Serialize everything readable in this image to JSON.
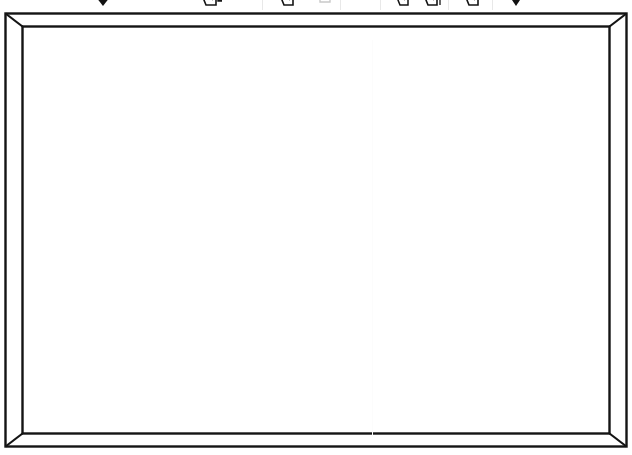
{
  "window": {
    "title": "Whiteboard Canvas",
    "background_color": "#ffffff"
  },
  "toolbar": {
    "visible_height_px": 12,
    "clipped": "true",
    "separator_color": "#e8e8e8",
    "icon_color": "#1a1a1a",
    "items": [
      {
        "id": "dropdown-left",
        "icon": "caret-down-icon",
        "label": "Options",
        "x": 92,
        "glyph": "▼"
      },
      {
        "id": "paste-group",
        "icon": "paste-icon",
        "label": "Paste",
        "x": 207,
        "glyph": ""
      },
      {
        "id": "paste-extra",
        "icon": "clipboard-icon",
        "label": "Paste Special",
        "x": 231,
        "glyph": ""
      },
      {
        "id": "copy-tool",
        "icon": "copy-icon",
        "label": "Copy",
        "x": 283,
        "glyph": ""
      },
      {
        "id": "cut-tool",
        "icon": "cut-icon",
        "label": "Cut",
        "x": 320,
        "glyph": ""
      },
      {
        "id": "line-tool",
        "icon": "line-icon",
        "label": "Line",
        "x": 357,
        "glyph": ""
      },
      {
        "id": "shape-tool",
        "icon": "shape-icon",
        "label": "Shape",
        "x": 398,
        "glyph": ""
      },
      {
        "id": "duplicate-tool",
        "icon": "duplicate-icon",
        "label": "Duplicate",
        "x": 428,
        "glyph": ""
      },
      {
        "id": "group-tool",
        "icon": "group-icon",
        "label": "Group",
        "x": 468,
        "glyph": ""
      },
      {
        "id": "dropdown-right",
        "icon": "caret-down-icon",
        "label": "More",
        "x": 512,
        "glyph": "▼"
      }
    ],
    "separators": [
      {
        "x": 262
      },
      {
        "x": 340
      },
      {
        "x": 380
      },
      {
        "x": 448
      },
      {
        "x": 492
      }
    ]
  },
  "canvas": {
    "name": "whiteboard",
    "frame_style": "beveled-mitered",
    "frame_color": "#141414",
    "frame_fill": "#ffffff",
    "interior_color": "#ffffff",
    "outer": {
      "x": 5,
      "y": 3,
      "width": 622,
      "height": 434
    },
    "inner": {
      "x": 22,
      "y": 16,
      "width": 588,
      "height": 408
    },
    "border_width_px": 2,
    "seam": {
      "name": "panel-seam",
      "x": 372,
      "color": "#fcfcfc",
      "visible": "faint"
    },
    "content": ""
  }
}
